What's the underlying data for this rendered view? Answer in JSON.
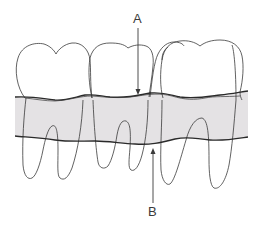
{
  "figure": {
    "type": "dental anatomy line drawing",
    "labels": [
      {
        "id": "A",
        "text": "A",
        "points_to": "upper boundary of shaded band (gingival margin)",
        "arrow_direction": "down"
      },
      {
        "id": "B",
        "text": "B",
        "points_to": "lower boundary of shaded band",
        "arrow_direction": "up"
      }
    ],
    "teeth_count": 3,
    "colors": {
      "line": "#3a3a3a",
      "band_fill": "#e4e2e4",
      "band_edge": "#2a2a2a",
      "background": "#ffffff"
    }
  }
}
